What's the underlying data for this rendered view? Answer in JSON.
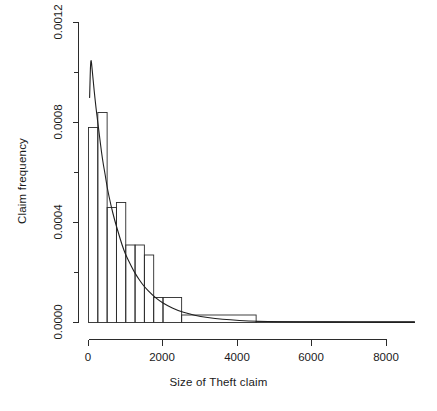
{
  "chart_data": {
    "type": "bar",
    "title": "",
    "subtitle": "",
    "xlabel": "Size of Theft claim",
    "ylabel": "Claim frequency",
    "xlim": [
      0,
      8750
    ],
    "ylim": [
      0.0,
      0.0012
    ],
    "grid": false,
    "legend": null,
    "annotations": [],
    "xticks": [
      0,
      2000,
      4000,
      6000,
      8000
    ],
    "xtick_labels": [
      "0",
      "2000",
      "4000",
      "6000",
      "8000"
    ],
    "yticks": [
      0.0,
      0.0002,
      0.0004,
      0.0006,
      0.0008,
      0.001,
      0.0012
    ],
    "ytick_labels": [
      "0.0000",
      "",
      "0.0004",
      "",
      "0.0008",
      "",
      "0.0012"
    ],
    "ytick_labels_major": [
      "0.0000",
      "0.0004",
      "0.0008",
      "0.0012"
    ],
    "bin_edges": [
      0,
      250,
      500,
      750,
      1000,
      1250,
      1500,
      1750,
      2000,
      2500,
      3000,
      4500,
      8750
    ],
    "bin_heights": [
      0.00078,
      0.00084,
      0.00046,
      0.00048,
      0.00031,
      0.00031,
      0.00027,
      0.0001,
      0.0001,
      3.5e-05,
      3.5e-05,
      3.5e-06
    ],
    "bars": [
      {
        "x0": 0,
        "x1": 250,
        "height": 0.00078
      },
      {
        "x0": 250,
        "x1": 500,
        "height": 0.00084
      },
      {
        "x0": 500,
        "x1": 750,
        "height": 0.00046
      },
      {
        "x0": 750,
        "x1": 1000,
        "height": 0.00048
      },
      {
        "x0": 1000,
        "x1": 1250,
        "height": 0.00031
      },
      {
        "x0": 1250,
        "x1": 1500,
        "height": 0.00031
      },
      {
        "x0": 1500,
        "x1": 1750,
        "height": 0.00027
      },
      {
        "x0": 1750,
        "x1": 2000,
        "height": 0.0001
      },
      {
        "x0": 2000,
        "x1": 2500,
        "height": 0.0001
      },
      {
        "x0": 2500,
        "x1": 4500,
        "height": 3e-05
      },
      {
        "x0": 4500,
        "x1": 8750,
        "height": 3.5e-06
      }
    ],
    "curve": {
      "name": "fitted density",
      "x": [
        30,
        60,
        100,
        150,
        200,
        250,
        300,
        350,
        400,
        450,
        500,
        600,
        700,
        800,
        900,
        1000,
        1100,
        1200,
        1300,
        1400,
        1500,
        1700,
        1900,
        2100,
        2400,
        2700,
        3000,
        3400,
        3800,
        4300,
        4800,
        5400,
        6000,
        6800,
        7600,
        8400,
        8750
      ],
      "y": [
        0.0009,
        0.00107,
        0.00101,
        0.00093,
        0.00086,
        0.0008,
        0.00074,
        0.00068,
        0.00063,
        0.00059,
        0.00054,
        0.00047,
        0.00041,
        0.00036,
        0.00031,
        0.00027,
        0.00024,
        0.00021,
        0.000185,
        0.000163,
        0.000143,
        0.000112,
        8.75e-05,
        6.9e-05,
        4.8e-05,
        3.4e-05,
        2.45e-05,
        1.55e-05,
        1.02e-05,
        6.2e-06,
        4e-06,
        2.6e-06,
        1.8e-06,
        1.2e-06,
        8e-07,
        6e-07,
        5e-07
      ]
    },
    "colors": {
      "axis": "#2b2b2b",
      "bar_stroke": "#2b2b2b",
      "bar_fill": "none",
      "curve": "#1f1f1f",
      "background": "#ffffff"
    }
  },
  "figure": {
    "x_axis_title": "Size of Theft claim",
    "y_axis_title": "Claim frequency",
    "x_tick_0": "0",
    "x_tick_1": "2000",
    "x_tick_2": "4000",
    "x_tick_3": "6000",
    "x_tick_4": "8000",
    "y_tick_0": "0.0000",
    "y_tick_1": "0.0004",
    "y_tick_2": "0.0008",
    "y_tick_3": "0.0012"
  }
}
